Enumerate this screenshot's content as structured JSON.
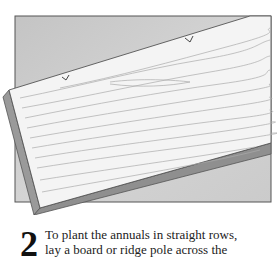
{
  "illustration": {
    "subject": "wooden board laid diagonally across soil bed with notches marking rows",
    "colors": {
      "soil": "#c9c9c9",
      "board_face": "#f3f3f3",
      "board_edge": "#8f8f8f",
      "outline": "#555555",
      "grain": "#a8a8a8"
    }
  },
  "step": {
    "number": "2",
    "text_line1": "To plant the annuals in straight rows,",
    "text_line2": "lay a board or ridge pole across the"
  }
}
